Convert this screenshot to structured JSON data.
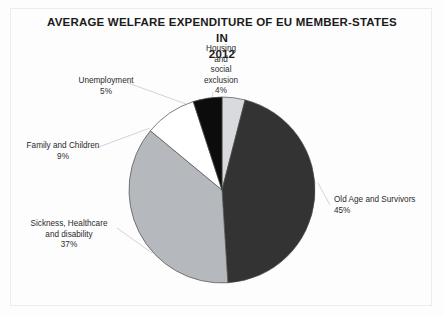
{
  "chart_data": {
    "type": "pie",
    "title": "AVERAGE WELFARE EXPENDITURE OF EU MEMBER-STATES IN 2012",
    "categories": [
      "Housing and social exclusion",
      "Old Age and Survivors",
      "Sickness, Healthcare and disability",
      "Family and Children",
      "Unemployment"
    ],
    "values": [
      4,
      45,
      37,
      9,
      5
    ],
    "value_suffix": "%",
    "colors": [
      "#d9dade",
      "#333333",
      "#b5b8bc",
      "#ffffff",
      "#0c0c0c"
    ],
    "start_angle_deg": 0,
    "direction": "clockwise",
    "legend": "none",
    "grid": false,
    "xlabel": "",
    "ylabel": ""
  },
  "title": {
    "line1": "AVERAGE WELFARE EXPENDITURE OF EU MEMBER-STATES IN",
    "line2": "2012"
  },
  "labels": {
    "housing": "Housing\nand\nsocial\nexclusion\n4%",
    "unemployment": "Unemployment\n5%",
    "family": "Family and Children\n9%",
    "sickness": "Sickness, Healthcare\nand disability\n37%",
    "oldage": "Old Age and Survivors\n45%"
  },
  "style": {
    "slice_outline": "#4a4a4a",
    "leader_line": "#c9c9c9",
    "page_background": "#fdfdfd",
    "text_color": "#2b2b2b"
  }
}
